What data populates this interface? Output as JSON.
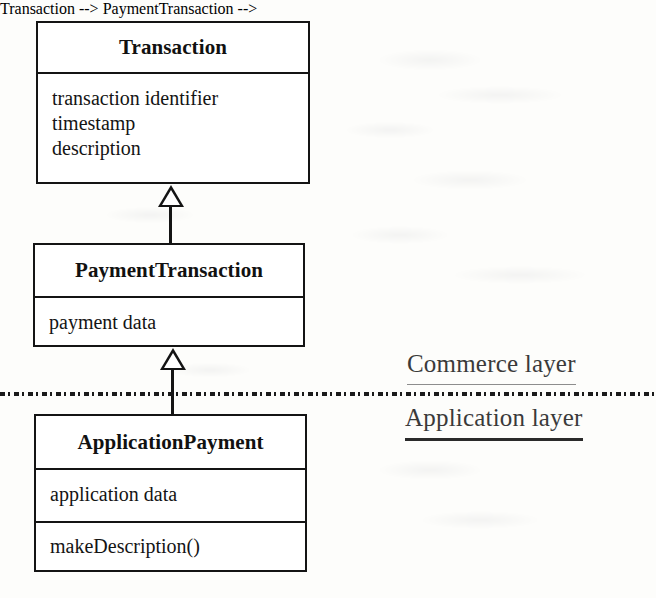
{
  "diagram": {
    "type": "uml-class-diagram",
    "classes": [
      {
        "id": "transaction",
        "name": "Transaction",
        "attributes": [
          "transaction identifier",
          "timestamp",
          "description"
        ],
        "operations": []
      },
      {
        "id": "payment-transaction",
        "name": "PaymentTransaction",
        "attributes": [
          "payment data"
        ],
        "operations": []
      },
      {
        "id": "application-payment",
        "name": "ApplicationPayment",
        "attributes": [
          "application data"
        ],
        "operations": [
          "makeDescription()"
        ]
      }
    ],
    "relationships": [
      {
        "kind": "generalization",
        "from": "PaymentTransaction",
        "to": "Transaction",
        "arrowhead": "hollow-triangle"
      },
      {
        "kind": "generalization",
        "from": "ApplicationPayment",
        "to": "PaymentTransaction",
        "arrowhead": "hollow-triangle"
      }
    ],
    "layers": {
      "separator_style": "dashed",
      "above_label": "Commerce layer",
      "below_label": "Application layer"
    },
    "colors": {
      "stroke": "#141414",
      "fill": "#ffffff",
      "background": "#fdfdfb",
      "label_text": "#3a3a3a"
    }
  }
}
